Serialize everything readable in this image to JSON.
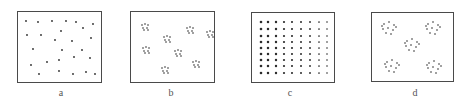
{
  "figure": {
    "dot_color": "#2b2b2b",
    "frame_color": "#4a4a4a",
    "panels": [
      {
        "id": "a",
        "label": "a",
        "pattern": "random",
        "frame": {
          "x": 17,
          "y": 11,
          "w": 85,
          "h": 72
        },
        "label_pos": {
          "x": 51,
          "y": 87
        },
        "dot_r": 0.9,
        "dots": [
          [
            8,
            9
          ],
          [
            20,
            10
          ],
          [
            34,
            9
          ],
          [
            48,
            9
          ],
          [
            58,
            10
          ],
          [
            75,
            12
          ],
          [
            65,
            16
          ],
          [
            43,
            19
          ],
          [
            9,
            23
          ],
          [
            23,
            23
          ],
          [
            37,
            28
          ],
          [
            54,
            29
          ],
          [
            73,
            26
          ],
          [
            15,
            37
          ],
          [
            44,
            38
          ],
          [
            64,
            38
          ],
          [
            56,
            45
          ],
          [
            72,
            46
          ],
          [
            41,
            48
          ],
          [
            13,
            53
          ],
          [
            29,
            50
          ],
          [
            41,
            59
          ],
          [
            68,
            60
          ],
          [
            21,
            62
          ],
          [
            55,
            62
          ],
          [
            77,
            62
          ]
        ]
      },
      {
        "id": "b",
        "label": "b",
        "pattern": "clustered-small",
        "frame": {
          "x": 130,
          "y": 11,
          "w": 85,
          "h": 72
        },
        "label_pos": {
          "x": 161,
          "y": 87
        },
        "dot_r": 0.8,
        "clusters": [
          [
            14,
            15
          ],
          [
            59,
            18
          ],
          [
            79,
            22
          ],
          [
            36,
            27
          ],
          [
            15,
            38
          ],
          [
            47,
            41
          ],
          [
            65,
            52
          ],
          [
            34,
            58
          ]
        ],
        "cluster_offsets": [
          [
            -3,
            -2
          ],
          [
            0,
            -3
          ],
          [
            3,
            -2
          ],
          [
            -2,
            1
          ],
          [
            2,
            1
          ],
          [
            -1,
            3
          ],
          [
            3,
            3
          ]
        ]
      },
      {
        "id": "c",
        "label": "c",
        "pattern": "uniform-grid",
        "frame": {
          "x": 251,
          "y": 12,
          "w": 84,
          "h": 71
        },
        "label_pos": {
          "x": 280,
          "y": 87
        },
        "grid": {
          "cols": [
            9,
            16,
            24,
            32,
            40,
            49,
            58,
            67,
            75
          ],
          "rows": [
            9,
            16,
            23,
            29,
            35,
            41,
            47,
            53,
            60
          ]
        },
        "dot_r_left": 1.3,
        "dot_r_right": 0.8
      },
      {
        "id": "d",
        "label": "d",
        "pattern": "clustered-large",
        "frame": {
          "x": 371,
          "y": 12,
          "w": 83,
          "h": 70
        },
        "label_pos": {
          "x": 405,
          "y": 87
        },
        "dot_r": 0.8,
        "clusters": [
          [
            17,
            15
          ],
          [
            61,
            15
          ],
          [
            40,
            32
          ],
          [
            20,
            53
          ],
          [
            62,
            54
          ]
        ],
        "cluster_offsets": [
          [
            -5,
            -4
          ],
          [
            0,
            -6
          ],
          [
            5,
            -3
          ],
          [
            -6,
            1
          ],
          [
            -1,
            0
          ],
          [
            4,
            2
          ],
          [
            -3,
            5
          ],
          [
            2,
            6
          ],
          [
            7,
            -1
          ],
          [
            -7,
            -2
          ]
        ]
      }
    ]
  }
}
